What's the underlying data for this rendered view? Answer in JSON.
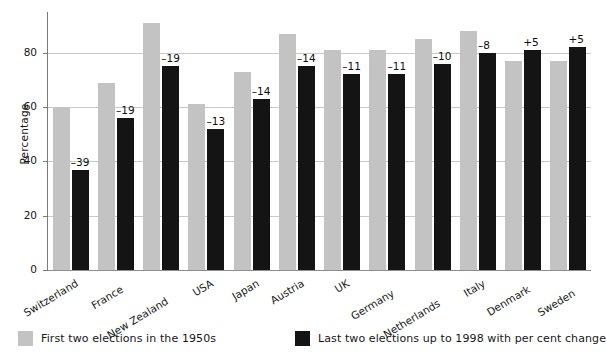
{
  "chart_data": {
    "type": "bar",
    "title": "",
    "subtitle": "",
    "xlabel": "",
    "ylabel": "Percentage",
    "ylim": [
      0,
      95
    ],
    "yticks": [
      0,
      20,
      40,
      60,
      80
    ],
    "ytick_labels": [
      "0",
      "20",
      "40",
      "60",
      "80"
    ],
    "grid": true,
    "grid_axis": "y",
    "legend_position": "bottom",
    "categories": [
      "Switzerland",
      "France",
      "New Zealand",
      "USA",
      "Japan",
      "Austria",
      "UK",
      "Germany",
      "Netherlands",
      "Italy",
      "Denmark",
      "Sweden"
    ],
    "series": [
      {
        "name": "First two elections in the 1950s",
        "color": "#c3c3c3",
        "values": [
          60,
          69,
          91,
          61,
          73,
          87,
          81,
          81,
          85,
          88,
          77,
          77
        ]
      },
      {
        "name": "Last two elections up to 1998 with per cent change",
        "color": "#141414",
        "values": [
          37,
          56,
          75,
          52,
          63,
          75,
          72,
          72,
          76,
          80,
          81,
          82
        ],
        "data_labels": [
          "–39",
          "–19",
          "–19",
          "–13",
          "–14",
          "–14",
          "–11",
          "–11",
          "–10",
          "–8",
          "+5",
          "+5"
        ]
      }
    ],
    "legend": [
      {
        "label": "First two elections in the 1950s",
        "color": "#c3c3c3"
      },
      {
        "label": "Last two elections up to 1998 with per cent change",
        "color": "#141414"
      }
    ]
  }
}
